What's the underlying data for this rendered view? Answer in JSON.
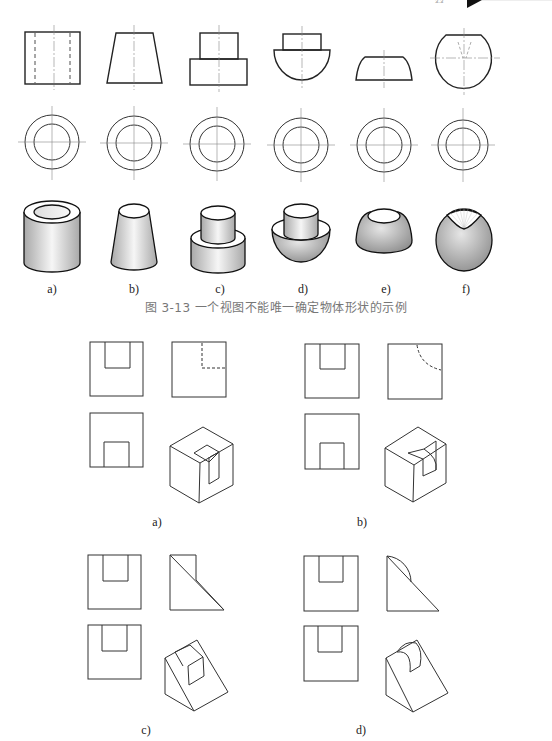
{
  "header": {
    "page_ref": "3.3",
    "marker": "black-triangle-tab"
  },
  "figure_3_13": {
    "caption": "图 3-13   一个视图不能唯一确定物体形状的示例",
    "labels": [
      "a)",
      "b)",
      "c)",
      "d)",
      "e)",
      "f)"
    ],
    "rows": [
      "front-view",
      "top-view",
      "isometric-view"
    ],
    "shapes": [
      "hollow-cylinder",
      "truncated-cone",
      "stepped-cylinder",
      "cylinder-on-hemisphere",
      "spherical-segment",
      "sphere-with-conical-cavity"
    ]
  },
  "figure_2": {
    "labels": [
      "a)",
      "b)",
      "c)",
      "d)"
    ],
    "panels": [
      {
        "label": "a)",
        "shape": "cube-with-rectangular-notch"
      },
      {
        "label": "b)",
        "shape": "cube-with-curved-notch"
      },
      {
        "label": "c)",
        "shape": "wedge-with-rectangular-notch"
      },
      {
        "label": "d)",
        "shape": "wedge-with-curved-notch"
      }
    ]
  },
  "colors": {
    "line": "#222222",
    "center_line": "#888888",
    "caption": "#777777",
    "shade_light": "#f2f2f2",
    "shade_dark": "#9a9a9a"
  }
}
